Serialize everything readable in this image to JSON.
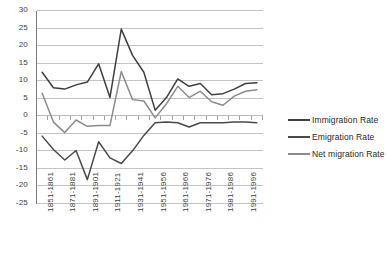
{
  "chart_data": {
    "type": "line",
    "title": "",
    "xlabel": "",
    "ylabel": "",
    "ylim": [
      -25,
      30
    ],
    "ytick_step": 5,
    "grid": true,
    "legend_position": "right",
    "x_tick_labels": [
      "1851-1861",
      "1871-1881",
      "1891-1901",
      "1911-1921",
      "1931-1941",
      "1951-1956",
      "1961-1966",
      "1971-1976",
      "1981-1986",
      "1991-1996"
    ],
    "x_tick_label_interval": 2,
    "y_tick_labels": [
      "30",
      "25",
      "20",
      "15",
      "10",
      "5",
      "0",
      "-5",
      "-10",
      "-15",
      "-20",
      "-25"
    ],
    "x": [
      "1851-1861",
      "1861-1871",
      "1871-1881",
      "1881-1891",
      "1891-1901",
      "1901-1911",
      "1911-1921",
      "1921-1931",
      "1931-1941",
      "1941-1951",
      "1951-1956",
      "1956-1961",
      "1961-1966",
      "1966-1971",
      "1971-1976",
      "1976-1981",
      "1981-1986",
      "1986-1991",
      "1991-1996",
      "1996-2001"
    ],
    "series": [
      {
        "name": "Immigration Rate",
        "color": "#3f3f3f",
        "values": [
          12.4,
          8.0,
          7.6,
          8.8,
          9.6,
          14.8,
          5.2,
          24.7,
          17.2,
          12.4,
          1.6,
          5.2,
          10.5,
          8.4,
          9.2,
          6.0,
          6.3,
          7.6,
          9.2,
          9.4
        ]
      },
      {
        "name": "Emigration Rate",
        "color": "#4a4a4a",
        "values": [
          -5.8,
          -9.6,
          -12.6,
          -9.9,
          -18.2,
          -7.4,
          -12.0,
          -13.6,
          -10.0,
          -5.6,
          -2.0,
          -1.8,
          -2.0,
          -3.2,
          -2.0,
          -2.0,
          -2.0,
          -1.8,
          -1.8,
          -2.0
        ]
      },
      {
        "name": "Net migration Rate",
        "color": "#8c8c8c",
        "values": [
          6.4,
          -1.8,
          -4.8,
          -1.2,
          -3.0,
          -2.8,
          -2.8,
          12.6,
          4.6,
          4.2,
          -0.6,
          3.4,
          8.4,
          5.2,
          7.0,
          4.0,
          3.0,
          5.6,
          7.0,
          7.4
        ]
      }
    ]
  },
  "legend": {
    "items": [
      {
        "label": "Immigration Rate",
        "color": "#3f3f3f"
      },
      {
        "label": "Emigration Rate",
        "color": "#4a4a4a"
      },
      {
        "label": "Net migration Rate",
        "color": "#8c8c8c"
      }
    ]
  }
}
